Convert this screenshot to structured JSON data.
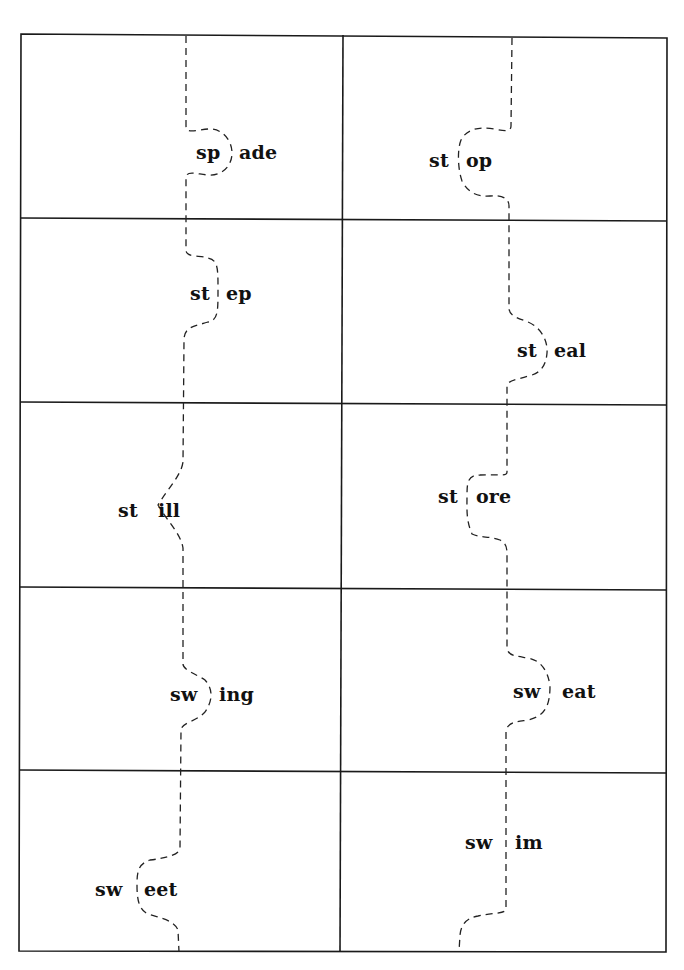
{
  "worksheet": {
    "type": "word puzzle cut-out cards",
    "rows": 5,
    "columns": 2,
    "cards": [
      {
        "row": 1,
        "col": 1,
        "blend": "sp",
        "ending": "ade",
        "word": "spade"
      },
      {
        "row": 1,
        "col": 2,
        "blend": "st",
        "ending": "op",
        "word": "stop"
      },
      {
        "row": 2,
        "col": 1,
        "blend": "st",
        "ending": "ep",
        "word": "step"
      },
      {
        "row": 2,
        "col": 2,
        "blend": "st",
        "ending": "eal",
        "word": "steal"
      },
      {
        "row": 3,
        "col": 1,
        "blend": "st",
        "ending": "ill",
        "word": "still"
      },
      {
        "row": 3,
        "col": 2,
        "blend": "st",
        "ending": "ore",
        "word": "store"
      },
      {
        "row": 4,
        "col": 1,
        "blend": "sw",
        "ending": "ing",
        "word": "swing"
      },
      {
        "row": 4,
        "col": 2,
        "blend": "sw",
        "ending": "eat",
        "word": "sweat"
      },
      {
        "row": 5,
        "col": 1,
        "blend": "sw",
        "ending": "eet",
        "word": "sweet"
      },
      {
        "row": 5,
        "col": 2,
        "blend": "sw",
        "ending": "im",
        "word": "swim"
      }
    ]
  },
  "colors": {
    "background": "#ffffff",
    "lines": "#1a1a1a",
    "text": "#111111"
  }
}
